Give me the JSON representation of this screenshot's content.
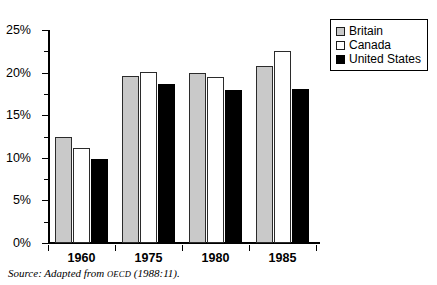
{
  "chart_data": {
    "type": "bar",
    "title": "",
    "xlabel": "",
    "ylabel": "",
    "categories": [
      "1960",
      "1975",
      "1980",
      "1985"
    ],
    "series": [
      {
        "name": "Britain",
        "color": "#c9c9c9",
        "values": [
          12.4,
          19.6,
          20.0,
          20.8
        ]
      },
      {
        "name": "Canada",
        "color": "#ffffff",
        "values": [
          11.1,
          20.1,
          19.5,
          22.5
        ]
      },
      {
        "name": "United States",
        "color": "#000000",
        "values": [
          9.9,
          18.7,
          18.0,
          18.1
        ]
      }
    ],
    "ylim": [
      0,
      25
    ],
    "ytick_values": [
      0,
      5,
      10,
      15,
      20,
      25
    ],
    "ytick_labels": [
      "0%",
      "5%",
      "10%",
      "15%",
      "20%",
      "25%"
    ],
    "yminor_values": [
      2.5,
      7.5,
      12.5,
      17.5,
      22.5
    ],
    "grid": false,
    "legend_position": "top-right"
  },
  "legend": {
    "items": [
      {
        "label": "Britain",
        "swatch": "britain"
      },
      {
        "label": "Canada",
        "swatch": "canada"
      },
      {
        "label": "United States",
        "swatch": "us"
      }
    ]
  },
  "caption": {
    "prefix": "Source: Adapted from ",
    "smallcaps": "OECD",
    "suffix": " (1988:11)."
  }
}
